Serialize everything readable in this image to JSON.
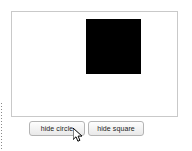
{
  "app": {
    "background_color": "#ffffff"
  },
  "canvas": {
    "name": "drawing-canvas",
    "border_color": "#c9c9c9",
    "fill_color": "#ffffff",
    "shapes": [
      {
        "name": "square",
        "visible": true,
        "color": "#000000",
        "width": 55,
        "height": 55
      },
      {
        "name": "circle",
        "visible": false,
        "color": "#000000"
      }
    ]
  },
  "controls": {
    "hide_circle_label": "hide circle",
    "hide_square_label": "hide square"
  },
  "cursor": {
    "name": "mouse-pointer",
    "x": 73,
    "y": 128
  },
  "guide": {
    "name": "dotted-guide-line",
    "color": "#8a8a8a"
  }
}
